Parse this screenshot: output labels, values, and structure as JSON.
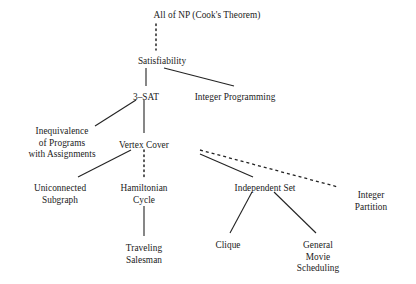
{
  "diagram": {
    "background_color": "#ffffff",
    "line_color": "#232323",
    "text_color": "#1a1a1a",
    "nodes": [
      {
        "id": "all-of-np",
        "label": "All of NP  (Cook's Theorem)",
        "x": 207,
        "y": 10
      },
      {
        "id": "satisfiability",
        "label": "Satisfiability",
        "x": 162,
        "y": 56
      },
      {
        "id": "three-sat",
        "label": "3–SAT",
        "x": 146,
        "y": 92
      },
      {
        "id": "integer-programming",
        "label": "Integer Programming",
        "x": 235,
        "y": 92
      },
      {
        "id": "inequivalence",
        "label": "Inequivalence\nof Programs\nwith Assignments",
        "x": 62,
        "y": 126
      },
      {
        "id": "vertex-cover",
        "label": "Vertex Cover",
        "x": 144,
        "y": 140
      },
      {
        "id": "uniconnected-subgraph",
        "label": "Uniconnected\nSubgraph",
        "x": 60,
        "y": 183
      },
      {
        "id": "hamiltonian-cycle",
        "label": "Hamiltonian\nCycle",
        "x": 144,
        "y": 183
      },
      {
        "id": "independent-set",
        "label": "Independent Set",
        "x": 265,
        "y": 183
      },
      {
        "id": "integer-partition",
        "label": "Integer Partition",
        "x": 371,
        "y": 190
      },
      {
        "id": "traveling-salesman",
        "label": "Traveling\nSalesman",
        "x": 144,
        "y": 243
      },
      {
        "id": "clique",
        "label": "Clique",
        "x": 228,
        "y": 240
      },
      {
        "id": "general-movie-scheduling",
        "label": "General\nMovie\nScheduling",
        "x": 318,
        "y": 240
      }
    ],
    "edges": [
      {
        "id": "np-to-sat",
        "from": "all-of-np",
        "to": "satisfiability",
        "style": "dotted",
        "x1": 156,
        "y1": 24,
        "x2": 156,
        "y2": 50
      },
      {
        "id": "sat-to-3sat",
        "from": "satisfiability",
        "to": "three-sat",
        "style": "solid",
        "x1": 146,
        "y1": 68,
        "x2": 146,
        "y2": 86
      },
      {
        "id": "sat-to-intprog",
        "from": "satisfiability",
        "to": "integer-programming",
        "style": "solid",
        "x1": 164,
        "y1": 68,
        "x2": 234,
        "y2": 86
      },
      {
        "id": "3sat-to-inequivalence",
        "from": "three-sat",
        "to": "inequivalence",
        "style": "solid",
        "x1": 136,
        "y1": 100,
        "x2": 95,
        "y2": 126
      },
      {
        "id": "3sat-to-vertexcover",
        "from": "three-sat",
        "to": "vertex-cover",
        "style": "solid",
        "x1": 144,
        "y1": 100,
        "x2": 144,
        "y2": 133
      },
      {
        "id": "vertexcover-to-uniconnected",
        "from": "vertex-cover",
        "to": "uniconnected-subgraph",
        "style": "solid",
        "x1": 131,
        "y1": 150,
        "x2": 78,
        "y2": 177
      },
      {
        "id": "vertexcover-to-hamiltonian",
        "from": "vertex-cover",
        "to": "hamiltonian-cycle",
        "style": "dotted",
        "x1": 144,
        "y1": 150,
        "x2": 144,
        "y2": 177
      },
      {
        "id": "vertexcover-to-independentset",
        "from": "vertex-cover",
        "to": "independent-set",
        "style": "solid",
        "x1": 200,
        "y1": 154,
        "x2": 253,
        "y2": 177
      },
      {
        "id": "vertexcover-to-integerpartition",
        "from": "vertex-cover",
        "to": "integer-partition",
        "style": "dashed",
        "x1": 200,
        "y1": 150,
        "x2": 338,
        "y2": 187
      },
      {
        "id": "hamiltonian-to-tsp",
        "from": "hamiltonian-cycle",
        "to": "traveling-salesman",
        "style": "solid",
        "x1": 144,
        "y1": 206,
        "x2": 144,
        "y2": 236
      },
      {
        "id": "independentset-to-clique",
        "from": "independent-set",
        "to": "clique",
        "style": "solid",
        "x1": 252,
        "y1": 192,
        "x2": 230,
        "y2": 233
      },
      {
        "id": "independentset-to-moviescheduling",
        "from": "independent-set",
        "to": "general-movie-scheduling",
        "style": "solid",
        "x1": 274,
        "y1": 192,
        "x2": 316,
        "y2": 233
      }
    ]
  }
}
